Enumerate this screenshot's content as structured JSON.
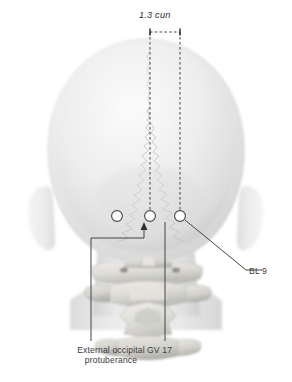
{
  "figure": {
    "view": "posterior",
    "background_color": "#ffffff"
  },
  "dimension": {
    "label": "1.3 cun",
    "value": 1.3,
    "unit": "cun",
    "from_point": "GV 17",
    "to_point": "BL 9"
  },
  "labels": {
    "external_occipital_protuberance": "External occipital\nprotuberance",
    "eop_line1": "External occipital",
    "eop_line2": "protuberance",
    "gv17": "GV 17",
    "bl9": "BL 9"
  },
  "points": [
    {
      "id": "bl9-left",
      "name": "BL 9 (left)",
      "cx": 117,
      "cy": 216,
      "r": 5.4,
      "fill": "#ffffff",
      "stroke": "#4a4a4a"
    },
    {
      "id": "gv17",
      "name": "GV 17",
      "cx": 150,
      "cy": 216,
      "r": 5.4,
      "fill": "#ffffff",
      "stroke": "#4a4a4a"
    },
    {
      "id": "bl9-right",
      "name": "BL 9 (right)",
      "cx": 180,
      "cy": 216,
      "r": 5.4,
      "fill": "#ffffff",
      "stroke": "#4a4a4a"
    }
  ],
  "anatomy": {
    "skull": "cranium posterior view",
    "sutures": "lambdoid suture",
    "ears": "auricles left and right",
    "vertebrae": "cervical vertebrae C1-C3",
    "shoulders": "trapezius / shoulders"
  },
  "colors": {
    "line": "#3c3c3c",
    "marker_fill": "#ffffff",
    "marker_stroke": "#4a4a4a",
    "skin_light": "#f2f2f2",
    "skin_mid": "#e2e2e2",
    "skin_shadow": "#cfcfcf",
    "bone": "#d8d8d6",
    "bone_shadow": "#a9a9a6",
    "text": "#3c3c3c"
  }
}
